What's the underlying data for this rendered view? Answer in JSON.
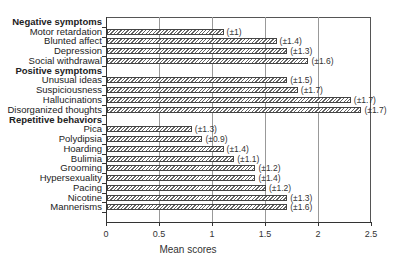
{
  "chart_data": {
    "type": "bar",
    "orientation": "horizontal",
    "title": "",
    "xlabel": "Mean scores",
    "ylabel": "",
    "xlim": [
      0,
      2.5
    ],
    "xticks": [
      "0",
      "0.5",
      "1",
      "1.5",
      "2",
      "2.5"
    ],
    "grid": "vertical",
    "legend": null,
    "groups": [
      {
        "name": "Negative symptoms",
        "items": [
          {
            "label": "Motor retardation",
            "value": 1.1,
            "sd": "(±1)"
          },
          {
            "label": "Blunted affect",
            "value": 1.6,
            "sd": "(±1.4)"
          },
          {
            "label": "Depression",
            "value": 1.7,
            "sd": "(±1.3)"
          },
          {
            "label": "Social withdrawal",
            "value": 1.9,
            "sd": "(±1.6)"
          }
        ]
      },
      {
        "name": "Positive symptoms",
        "items": [
          {
            "label": "Unusual ideas",
            "value": 1.7,
            "sd": "(±1.5)"
          },
          {
            "label": "Suspiciousness",
            "value": 1.8,
            "sd": "(±1.7)"
          },
          {
            "label": "Hallucinations",
            "value": 2.3,
            "sd": "(±1.7)"
          },
          {
            "label": "Disorganized thoughts",
            "value": 2.4,
            "sd": "(±1.7)"
          }
        ]
      },
      {
        "name": "Repetitive behaviors",
        "items": [
          {
            "label": "Pica",
            "value": 0.8,
            "sd": "(±1.3)"
          },
          {
            "label": "Polydipsia",
            "value": 0.9,
            "sd": "(±0.9)"
          },
          {
            "label": "Hoarding",
            "value": 1.1,
            "sd": "(±1.4)"
          },
          {
            "label": "Bulimia",
            "value": 1.2,
            "sd": "(±1.1)"
          },
          {
            "label": "Grooming",
            "value": 1.4,
            "sd": "(±1.2)"
          },
          {
            "label": "Hypersexuality",
            "value": 1.4,
            "sd": "(±1.4)"
          },
          {
            "label": "Pacing",
            "value": 1.5,
            "sd": "(±1.2)"
          },
          {
            "label": "Nicotine",
            "value": 1.7,
            "sd": "(±1.3)"
          },
          {
            "label": "Mannerisms",
            "value": 1.7,
            "sd": "(±1.6)"
          }
        ]
      }
    ]
  }
}
